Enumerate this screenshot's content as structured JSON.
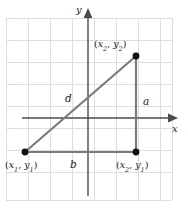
{
  "figure": {
    "type": "coordinate-plane-diagram",
    "topic": "distance-formula-right-triangle",
    "background_color": "#ffffff",
    "grid_color": "#d8dee6",
    "grid_border_color": "#c9d2dc",
    "axis_color": "#4a4a4a",
    "triangle_color": "#787878",
    "point_color": "#111111",
    "text_color": "#1a1a1a"
  },
  "axes": {
    "x_label": "x",
    "y_label": "y",
    "x_axis_y_px": 118,
    "y_axis_x_px": 88
  },
  "grid": {
    "left_px": 6,
    "top_px": 18,
    "right_px": 172,
    "bottom_px": 200,
    "cell_width_px": 22,
    "cell_height_px": 22,
    "columns": 8,
    "rows": 8
  },
  "points": [
    {
      "name": "vertex-top-right",
      "label_text": "(x2, y2)",
      "label_parts": {
        "open": "(",
        "v1": "x",
        "s1": "2",
        "comma": ", ",
        "v2": "y",
        "s2": "2",
        "close": ")"
      },
      "x_px": 136,
      "y_px": 56
    },
    {
      "name": "vertex-bottom-left",
      "label_text": "(x1, y1)",
      "label_parts": {
        "open": "(",
        "v1": "x",
        "s1": "1",
        "comma": ", ",
        "v2": "y",
        "s2": "1",
        "close": ")"
      },
      "x_px": 25,
      "y_px": 152
    },
    {
      "name": "vertex-bottom-right",
      "label_text": "(x2, y1)",
      "label_parts": {
        "open": "(",
        "v1": "x",
        "s1": "2",
        "comma": ", ",
        "v2": "y",
        "s2": "1",
        "close": ")"
      },
      "x_px": 136,
      "y_px": 152
    }
  ],
  "sides": [
    {
      "name": "hypotenuse",
      "label": "d",
      "from": "vertex-bottom-left",
      "to": "vertex-top-right"
    },
    {
      "name": "vertical-leg",
      "label": "a",
      "from": "vertex-bottom-right",
      "to": "vertex-top-right"
    },
    {
      "name": "horizontal-leg",
      "label": "b",
      "from": "vertex-bottom-left",
      "to": "vertex-bottom-right"
    }
  ],
  "labels": {
    "hypotenuse": "d",
    "vertical_leg": "a",
    "horizontal_leg": "b"
  }
}
